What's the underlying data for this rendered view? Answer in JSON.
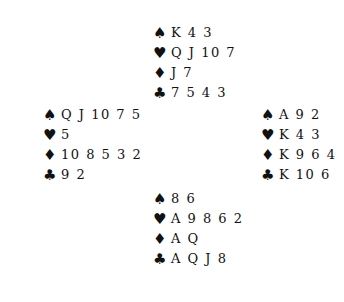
{
  "suits": {
    "spades": "♠",
    "hearts": "♥",
    "diamonds": "♦",
    "clubs": "♣"
  },
  "hands": {
    "north": {
      "spades": "K 4 3",
      "hearts": "Q J 10 7",
      "diamonds": "J 7",
      "clubs": "7 5 4 3"
    },
    "west": {
      "spades": "Q J 10 7 5",
      "hearts": "5",
      "diamonds": "10 8 5 3 2",
      "clubs": "9 2"
    },
    "east": {
      "spades": "A 9 2",
      "hearts": "K 4 3",
      "diamonds": "K 9 6 4",
      "clubs": "K 10 6"
    },
    "south": {
      "spades": "8 6",
      "hearts": "A 9 8 6 2",
      "diamonds": "A Q",
      "clubs": "A Q J 8"
    }
  }
}
